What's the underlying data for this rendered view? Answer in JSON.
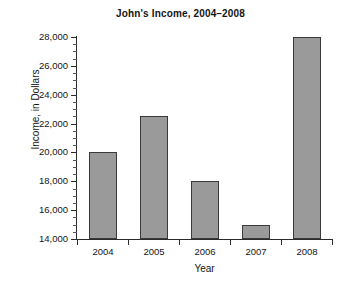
{
  "chart_data": {
    "type": "bar",
    "title": "John's Income, 2004–2008",
    "xlabel": "Year",
    "ylabel": "Income, in Dollars",
    "categories": [
      "2004",
      "2005",
      "2006",
      "2007",
      "2008"
    ],
    "values": [
      20000,
      22500,
      18000,
      15000,
      28000
    ],
    "ylim": [
      14000,
      28000
    ],
    "ytick_values": [
      14000,
      16000,
      18000,
      20000,
      22000,
      24000,
      26000,
      28000
    ],
    "ytick_labels": [
      "14,000",
      "16,000",
      "18,000",
      "20,000",
      "22,000",
      "24,000",
      "26,000",
      "28,000"
    ],
    "minor_tick_step": 500,
    "grid": false,
    "legend": null,
    "bar_color": "#9a9a9a",
    "bar_edge_color": "#3a3a3a",
    "axis_color": "#2b2b2b",
    "background": "#ffffff"
  }
}
